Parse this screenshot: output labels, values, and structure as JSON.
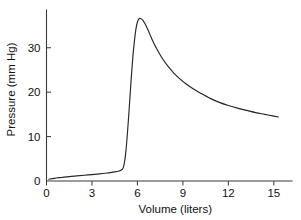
{
  "chart_data": {
    "type": "line",
    "title": "",
    "xlabel": "Volume (liters)",
    "ylabel": "Pressure (mm Hg)",
    "xlim": [
      0,
      16.2
    ],
    "ylim": [
      0,
      38.5
    ],
    "xticks": [
      0,
      3,
      6,
      9,
      12,
      15
    ],
    "xtick_labels": [
      "0",
      "3",
      "6",
      "9",
      "12",
      "15"
    ],
    "yticks": [
      0,
      10,
      20,
      30
    ],
    "ytick_labels": [
      "0",
      "10",
      "20",
      "30"
    ],
    "grid": false,
    "legend": false,
    "legend_position": "none",
    "line_color": "#262626",
    "background_color": "#ffffff",
    "axis_color": "#3a3a3a",
    "series": [
      {
        "name": "Pressure-volume curve",
        "x": [
          0.15,
          0.5,
          1.0,
          1.5,
          2.0,
          2.5,
          3.0,
          3.5,
          4.0,
          4.3,
          4.6,
          4.8,
          5.0,
          5.1,
          5.2,
          5.3,
          5.4,
          5.5,
          5.6,
          5.7,
          5.8,
          5.9,
          6.0,
          6.1,
          6.2,
          6.35,
          6.5,
          6.7,
          6.9,
          7.1,
          7.4,
          7.7,
          8.0,
          8.4,
          8.8,
          9.2,
          9.7,
          10.2,
          10.8,
          11.4,
          12.0,
          12.6,
          13.2,
          13.8,
          14.4,
          15.0,
          15.3
        ],
        "y": [
          0.4,
          0.6,
          0.8,
          1.0,
          1.15,
          1.3,
          1.45,
          1.6,
          1.8,
          1.95,
          2.1,
          2.25,
          2.6,
          3.4,
          5.5,
          9.0,
          13.5,
          18.5,
          23.5,
          28.0,
          31.5,
          34.2,
          35.8,
          36.5,
          36.6,
          36.2,
          35.4,
          34.0,
          32.4,
          30.9,
          29.0,
          27.3,
          25.9,
          24.3,
          23.0,
          21.9,
          20.7,
          19.7,
          18.6,
          17.7,
          17.0,
          16.4,
          15.9,
          15.4,
          15.0,
          14.6,
          14.4
        ]
      }
    ]
  }
}
